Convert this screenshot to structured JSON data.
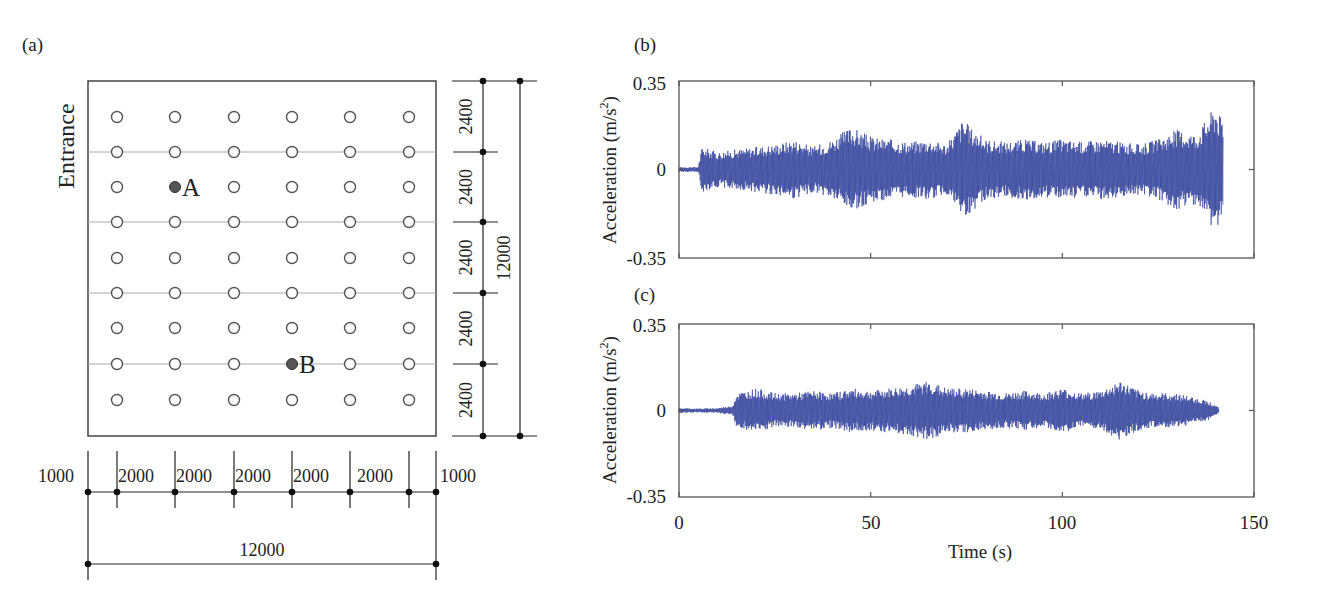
{
  "panels": {
    "a": {
      "label": "(a)"
    },
    "b": {
      "label": "(b)"
    },
    "c": {
      "label": "(c)"
    }
  },
  "floor_plan": {
    "entrance_label": "Entrance",
    "columns": 6,
    "rows": 9,
    "points": [
      {
        "label": "A",
        "col": 2,
        "row": 3
      },
      {
        "label": "B",
        "col": 4,
        "row": 8
      }
    ],
    "right_dims": {
      "segments": [
        "2400",
        "2400",
        "2400",
        "2400",
        "2400"
      ],
      "total": "12000"
    },
    "bottom_dims": {
      "segments": [
        "1000",
        "2000",
        "2000",
        "2000",
        "2000",
        "2000",
        "1000"
      ],
      "total": "12000"
    }
  },
  "chart_data": [
    {
      "type": "line",
      "panel": "(b)",
      "title": "",
      "xlabel": "",
      "ylabel": "Acceleration (m/s^2)",
      "ylabel_parts": {
        "base": "Acceleration (m/s",
        "sup": "2",
        "end": ")"
      },
      "xlim": [
        0,
        150
      ],
      "ylim": [
        -0.35,
        0.35
      ],
      "yticks": [
        "0.35",
        "0",
        "-0.35"
      ],
      "xticks": [
        0,
        50,
        100,
        150
      ],
      "series": [
        {
          "name": "Point A acceleration",
          "color": "#2a3b97",
          "envelope": {
            "t": [
              0,
              5,
              6,
              10,
              15,
              20,
              25,
              30,
              35,
              40,
              45,
              50,
              55,
              60,
              65,
              70,
              74,
              76,
              80,
              85,
              90,
              95,
              100,
              105,
              110,
              115,
              120,
              125,
              130,
              135,
              140,
              142
            ],
            "amp": [
              0.01,
              0.01,
              0.09,
              0.07,
              0.08,
              0.09,
              0.1,
              0.12,
              0.09,
              0.12,
              0.17,
              0.13,
              0.12,
              0.11,
              0.12,
              0.1,
              0.2,
              0.17,
              0.12,
              0.11,
              0.12,
              0.11,
              0.12,
              0.11,
              0.12,
              0.11,
              0.1,
              0.12,
              0.16,
              0.14,
              0.26,
              0.18
            ]
          }
        }
      ],
      "grid": false
    },
    {
      "type": "line",
      "panel": "(c)",
      "title": "",
      "xlabel": "Time (s)",
      "ylabel": "Acceleration (m/s^2)",
      "ylabel_parts": {
        "base": "Acceleration (m/s",
        "sup": "2",
        "end": ")"
      },
      "xlim": [
        0,
        150
      ],
      "ylim": [
        -0.35,
        0.35
      ],
      "yticks": [
        "0.35",
        "0",
        "-0.35"
      ],
      "xticks": [
        0,
        50,
        100,
        150
      ],
      "xtick_labels": [
        "0",
        "50",
        "100",
        "150"
      ],
      "series": [
        {
          "name": "Point B acceleration",
          "color": "#2a3b97",
          "envelope": {
            "t": [
              0,
              5,
              10,
              14,
              15,
              20,
              25,
              30,
              35,
              40,
              45,
              50,
              55,
              60,
              65,
              70,
              75,
              80,
              85,
              90,
              95,
              100,
              105,
              110,
              115,
              120,
              125,
              130,
              135,
              138,
              140,
              141
            ],
            "amp": [
              0.01,
              0.008,
              0.01,
              0.02,
              0.07,
              0.09,
              0.07,
              0.07,
              0.08,
              0.07,
              0.09,
              0.08,
              0.09,
              0.1,
              0.12,
              0.09,
              0.09,
              0.08,
              0.07,
              0.08,
              0.07,
              0.09,
              0.07,
              0.08,
              0.12,
              0.08,
              0.07,
              0.07,
              0.05,
              0.04,
              0.02,
              0.01
            ]
          }
        }
      ],
      "grid": false
    }
  ]
}
